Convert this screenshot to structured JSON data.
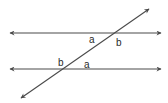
{
  "diagram": {
    "type": "parallel-lines-transversal",
    "line_color": "#4a4a4a",
    "upper_line": {
      "x1": 10,
      "y1": 33,
      "x2": 161,
      "y2": 33
    },
    "lower_line": {
      "x1": 10,
      "y1": 69,
      "x2": 161,
      "y2": 69
    },
    "transversal": {
      "x1": 21,
      "y1": 98,
      "x2": 149,
      "y2": 9
    },
    "labels": [
      {
        "id": "upper-a",
        "text": "a",
        "x": 89,
        "y": 35
      },
      {
        "id": "upper-b",
        "text": "b",
        "x": 116,
        "y": 38
      },
      {
        "id": "lower-b",
        "text": "b",
        "x": 58,
        "y": 58
      },
      {
        "id": "lower-a",
        "text": "a",
        "x": 84,
        "y": 60
      }
    ]
  }
}
